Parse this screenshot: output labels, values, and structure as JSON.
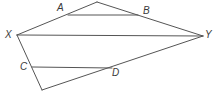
{
  "diagram": {
    "stroke_color": "#555555",
    "labels": {
      "A": "A",
      "B": "B",
      "X": "X",
      "Y": "Y",
      "C": "C",
      "D": "D"
    },
    "points": {
      "top_apex": [
        97,
        2
      ],
      "X": [
        17,
        35
      ],
      "Y": [
        203,
        36
      ],
      "bottom_apex": [
        42,
        90
      ],
      "A_on_segment": [
        68,
        15
      ],
      "B_on_segment": [
        138,
        15
      ],
      "C_on_segment": [
        32,
        67
      ],
      "D_on_segment": [
        112,
        68
      ]
    },
    "segments": [
      [
        "X",
        "top_apex"
      ],
      [
        "top_apex",
        "Y"
      ],
      [
        "X",
        "Y"
      ],
      [
        "X",
        "bottom_apex"
      ],
      [
        "bottom_apex",
        "Y"
      ],
      [
        "A_on_segment",
        "B_on_segment"
      ],
      [
        "C_on_segment",
        "D_on_segment"
      ]
    ]
  }
}
